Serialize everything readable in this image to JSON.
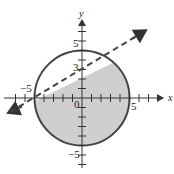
{
  "diagram": {
    "type": "graph of inequality region",
    "axes": {
      "x_label": "x",
      "y_label": "y",
      "x_range": [
        -7,
        7
      ],
      "y_range": [
        -7,
        7
      ],
      "tick_step": 1
    },
    "labels": {
      "x_neg5": "−5",
      "x_pos5": "5",
      "y_pos5": "5",
      "y_pos3": "3",
      "y_neg5": "−5",
      "origin": "0"
    },
    "circle": {
      "center": [
        0,
        0
      ],
      "radius": 5,
      "style": "solid"
    },
    "line": {
      "points": [
        [
          -5,
          0
        ],
        [
          0,
          3
        ]
      ],
      "slope": 0.6,
      "intercept": 3,
      "style": "dashed"
    },
    "shaded_region": "inside circle and below line",
    "colors": {
      "shade": "#cfcfcf",
      "stroke": "#444444",
      "axis": "#333333"
    }
  }
}
